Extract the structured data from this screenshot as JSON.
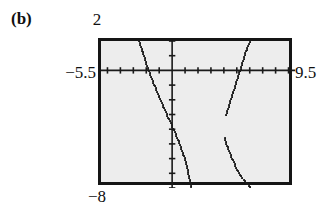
{
  "figure": {
    "part_label": "(b)",
    "device": "graphing-calculator-screen"
  },
  "window": {
    "xmin_label": "−5.5",
    "xmax_label": "9.5",
    "ymax_label": "2",
    "ymin_label": "−8"
  },
  "chart_data": {
    "type": "line",
    "title": "",
    "subtitle": "",
    "xlabel": "",
    "ylabel": "",
    "xlim": [
      -5.5,
      9.5
    ],
    "ylim": [
      -8,
      2
    ],
    "grid": false,
    "legend": null,
    "axes": {
      "x_axis_value": 0,
      "y_axis_value": 0,
      "x_tick_spacing": 1,
      "y_tick_spacing": 1,
      "tick_style": "short-marks-on-axis"
    },
    "tick_labels": {
      "x": [
        "-5.5",
        "9.5"
      ],
      "y": [
        "-8",
        "2"
      ]
    },
    "series": [
      {
        "name": "branch-left",
        "style": "dotted-pixel-trace",
        "x": [
          -2.55,
          -2.45,
          -2.35,
          -2.25,
          -2.15,
          -2.05,
          -1.95,
          -1.85,
          -1.75,
          -1.65,
          -1.55,
          -1.45,
          -1.35,
          -1.25,
          -1.15,
          -1.05,
          -0.95,
          -0.85,
          -0.75,
          -0.6,
          -0.45,
          -0.3,
          -0.15,
          0.0,
          0.15,
          0.3,
          0.45,
          0.6,
          0.75,
          0.9,
          1.05,
          1.2,
          1.3,
          1.4,
          1.5
        ],
        "y": [
          2.0,
          1.72,
          1.44,
          1.16,
          0.88,
          0.6,
          0.33,
          0.08,
          -0.17,
          -0.4,
          -0.62,
          -0.85,
          -1.07,
          -1.28,
          -1.5,
          -1.7,
          -1.9,
          -2.1,
          -2.3,
          -2.6,
          -2.9,
          -3.2,
          -3.5,
          -3.8,
          -4.1,
          -4.4,
          -4.72,
          -5.05,
          -5.4,
          -5.8,
          -6.25,
          -6.75,
          -7.2,
          -7.6,
          -8.0
        ]
      },
      {
        "name": "branch-right-upper",
        "style": "dotted-pixel-trace",
        "x": [
          4.2,
          4.3,
          4.42,
          4.55,
          4.68,
          4.8,
          4.92,
          5.05,
          5.18,
          5.3,
          5.42,
          5.55,
          5.68,
          5.8,
          5.92,
          6.05
        ],
        "y": [
          -3.0,
          -2.65,
          -2.3,
          -1.95,
          -1.6,
          -1.25,
          -0.9,
          -0.55,
          -0.2,
          0.15,
          0.5,
          0.85,
          1.2,
          1.5,
          1.78,
          2.0
        ]
      },
      {
        "name": "branch-right-lower",
        "style": "dotted-pixel-trace",
        "x": [
          4.05,
          4.18,
          4.32,
          4.48,
          4.65,
          4.82,
          5.0,
          5.2,
          5.42,
          5.65,
          5.9,
          6.12
        ],
        "y": [
          -4.6,
          -4.95,
          -5.3,
          -5.65,
          -6.0,
          -6.35,
          -6.7,
          -7.0,
          -7.3,
          -7.6,
          -7.85,
          -8.0
        ]
      }
    ]
  },
  "colors": {
    "screen_background": "#ededed",
    "screen_border": "#151515",
    "trace": "#1a1a1a",
    "axis": "#1a1a1a",
    "text": "#101010",
    "page_background": "#ffffff"
  }
}
